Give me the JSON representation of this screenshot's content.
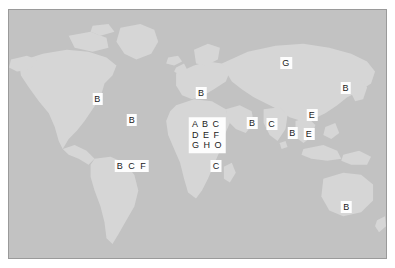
{
  "figure": {
    "kind": "map",
    "background_color": "#ffffff"
  },
  "map": {
    "ocean_color": "#c2c2c2",
    "land_color": "#d6d6d6",
    "border_color": "#9a9a9a",
    "marker_box_color": "#fdfdfd",
    "marker_text_color": "#1a1a1a",
    "projection": "equirectangular"
  },
  "markers": [
    {
      "id": "north-america-west",
      "text": "B",
      "x": 23.5,
      "y": 36.0,
      "region": "North America (west)",
      "style": "single"
    },
    {
      "id": "north-america-southeast",
      "text": "B",
      "x": 32.6,
      "y": 44.5,
      "region": "North America (southeast)",
      "style": "single"
    },
    {
      "id": "europe",
      "text": "B",
      "x": 51.0,
      "y": 33.5,
      "region": "Europe",
      "style": "single"
    },
    {
      "id": "russia-north",
      "text": "G",
      "x": 73.5,
      "y": 21.5,
      "region": "Northern Asia",
      "style": "single"
    },
    {
      "id": "east-asia-japan",
      "text": "B",
      "x": 89.3,
      "y": 31.5,
      "region": "East Asia",
      "style": "single"
    },
    {
      "id": "south-america",
      "text": "B C F",
      "x": 32.6,
      "y": 63.0,
      "region": "South America",
      "style": "row"
    },
    {
      "id": "africa-central-grid",
      "text": "A B C\nD E F\nG H O",
      "x": 52.6,
      "y": 50.5,
      "region": "Central Africa",
      "style": "grid"
    },
    {
      "id": "africa-south",
      "text": "C",
      "x": 55.0,
      "y": 63.0,
      "region": "Southern Africa",
      "style": "single"
    },
    {
      "id": "middle-east",
      "text": "B",
      "x": 64.5,
      "y": 45.5,
      "region": "Middle East",
      "style": "single"
    },
    {
      "id": "south-asia-west",
      "text": "C",
      "x": 69.7,
      "y": 45.8,
      "region": "South Asia",
      "style": "single"
    },
    {
      "id": "southeast-asia",
      "text": "B",
      "x": 75.2,
      "y": 49.5,
      "region": "Southeast Asia",
      "style": "single"
    },
    {
      "id": "east-asia-upper",
      "text": "E",
      "x": 80.4,
      "y": 42.5,
      "region": "East Asia (upper)",
      "style": "single"
    },
    {
      "id": "east-asia-lower",
      "text": "E",
      "x": 79.6,
      "y": 49.8,
      "region": "East Asia (lower)",
      "style": "single"
    },
    {
      "id": "australia",
      "text": "B",
      "x": 89.5,
      "y": 79.5,
      "region": "Australia",
      "style": "single"
    }
  ]
}
